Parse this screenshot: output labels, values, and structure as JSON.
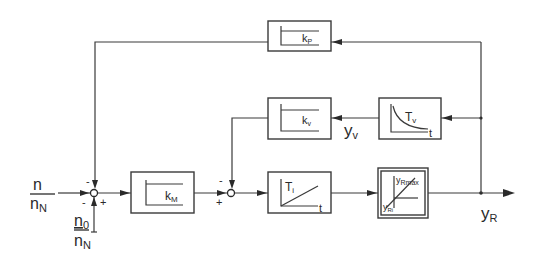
{
  "diagram": {
    "type": "block-diagram",
    "inputs": {
      "main": {
        "num": "n",
        "den": "n",
        "den_sub": "N"
      },
      "offset": {
        "num": "n",
        "num_sub": "0",
        "den": "n",
        "den_sub": "N"
      }
    },
    "blocks": {
      "kp": {
        "label": "k",
        "sub": "P",
        "kind": "proportional"
      },
      "kv": {
        "label": "k",
        "sub": "v",
        "kind": "proportional"
      },
      "tv": {
        "label": "T",
        "sub": "v",
        "axis": "t",
        "kind": "decay"
      },
      "km": {
        "label": "k",
        "sub": "M",
        "kind": "proportional"
      },
      "ti": {
        "label": "T",
        "sub": "i",
        "axis": "t",
        "kind": "integrator"
      },
      "limiter": {
        "top": "y",
        "top_sub": "Rmax",
        "bottom": "y",
        "bottom_sub": "Ri",
        "kind": "limiter"
      }
    },
    "signals": {
      "yv": {
        "label": "y",
        "sub": "v"
      },
      "yr": {
        "label": "y",
        "sub": "R"
      }
    },
    "signs": {
      "sum1_top": "-",
      "sum1_left": "-",
      "sum1_bottom": "+",
      "sum2_top": "-",
      "sum2_left": "+"
    }
  }
}
